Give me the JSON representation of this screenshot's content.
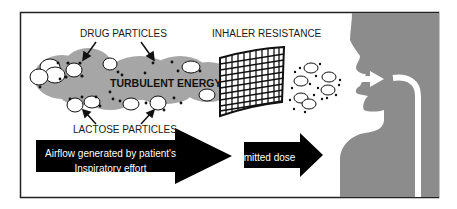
{
  "diagram": {
    "labels": {
      "drug_particles": "DRUG PARTICLES",
      "inhaler_resistance": "INHALER RESISTANCE",
      "turbulent_energy": "TURBULENT ENERGY",
      "lactose_particles": "LACTOSE PARTICLES",
      "airflow_line1": "Airflow generated by patient's",
      "airflow_line2": "Inspiratory effort",
      "emitted_dose": "Emitted dose"
    },
    "colors": {
      "frame": "#222222",
      "cloud": "#a6a6a6",
      "head": "#8c8c8c",
      "arrow": "#000000",
      "airflow_text": "#ffffff"
    }
  }
}
